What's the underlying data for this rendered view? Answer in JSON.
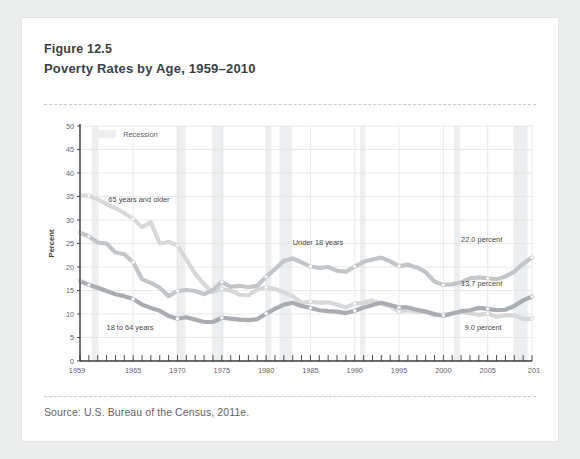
{
  "figure": {
    "number": "Figure 12.5",
    "title": "Poverty Rates by Age, 1959–2010",
    "source": "Source: U.S. Bureau of the Census, 2011e."
  },
  "legend": {
    "recession_label": "Recession",
    "recession_color": "#eceef0"
  },
  "colors": {
    "series_65_plus": "#d6d8da",
    "series_under_18": "#c3c6c9",
    "series_18_64": "#a9adb1",
    "grid": "#e2e3e5",
    "axis": "#3a3a3a",
    "text": "#5f6368"
  },
  "chart_data": {
    "type": "line",
    "title": "Poverty Rates by Age, 1959–2010",
    "xlabel": "",
    "ylabel": "Percent",
    "ylim": [
      0,
      50
    ],
    "ytick_step": 5,
    "yticks": [
      0,
      5,
      10,
      15,
      20,
      25,
      30,
      35,
      40,
      45,
      50
    ],
    "xlim": [
      1959,
      2010
    ],
    "xticks": [
      1959,
      1965,
      1970,
      1975,
      1980,
      1985,
      1990,
      1995,
      2000,
      2005,
      2010
    ],
    "xtick_minor_step": 1,
    "grid": true,
    "legend_position": "top-left",
    "x": [
      1959,
      1960,
      1961,
      1962,
      1963,
      1964,
      1965,
      1966,
      1967,
      1968,
      1969,
      1970,
      1971,
      1972,
      1973,
      1974,
      1975,
      1976,
      1977,
      1978,
      1979,
      1980,
      1981,
      1982,
      1983,
      1984,
      1985,
      1986,
      1987,
      1988,
      1989,
      1990,
      1991,
      1992,
      1993,
      1994,
      1995,
      1996,
      1997,
      1998,
      1999,
      2000,
      2001,
      2002,
      2003,
      2004,
      2005,
      2006,
      2007,
      2008,
      2009,
      2010
    ],
    "series": [
      {
        "name": "65 years and older",
        "label": "65 years and older",
        "end_label": "9.0 percent",
        "color": "#d6d8da",
        "values": [
          35.2,
          35.2,
          34.4,
          33.4,
          32.5,
          31.5,
          30.2,
          28.5,
          29.5,
          25.0,
          25.3,
          24.6,
          21.6,
          18.6,
          16.3,
          14.6,
          15.3,
          15.0,
          14.1,
          14.0,
          15.2,
          15.7,
          15.3,
          14.6,
          13.8,
          12.4,
          12.6,
          12.4,
          12.5,
          12.0,
          11.4,
          12.2,
          12.4,
          12.9,
          12.2,
          11.7,
          10.5,
          10.8,
          10.5,
          10.5,
          9.7,
          9.9,
          10.1,
          10.4,
          10.2,
          9.8,
          10.1,
          9.4,
          9.7,
          9.7,
          8.9,
          9.0
        ]
      },
      {
        "name": "Under 18 years",
        "label": "Under 18 years",
        "end_label": "22.0 percent",
        "color": "#c3c6c9",
        "values": [
          27.3,
          26.5,
          25.2,
          25.0,
          23.1,
          22.7,
          21.0,
          17.4,
          16.6,
          15.6,
          13.8,
          14.9,
          15.1,
          14.9,
          14.2,
          15.1,
          16.8,
          15.8,
          16.0,
          15.7,
          16.0,
          17.9,
          19.5,
          21.3,
          21.8,
          21.0,
          20.1,
          19.8,
          20.0,
          19.2,
          19.0,
          20.1,
          21.1,
          21.6,
          22.0,
          21.2,
          20.2,
          20.5,
          19.9,
          18.9,
          16.9,
          16.2,
          16.3,
          16.7,
          17.6,
          17.8,
          17.6,
          17.4,
          18.0,
          19.0,
          20.7,
          22.0
        ]
      },
      {
        "name": "18 to 64 years",
        "label": "18 to 64 years",
        "end_label": "13.7 percent",
        "color": "#a9adb1",
        "values": [
          17.0,
          16.2,
          15.6,
          14.9,
          14.2,
          13.8,
          13.2,
          12.0,
          11.3,
          10.7,
          9.6,
          9.0,
          9.3,
          8.8,
          8.3,
          8.3,
          9.2,
          9.0,
          8.8,
          8.7,
          8.9,
          10.1,
          11.1,
          12.0,
          12.4,
          11.7,
          11.3,
          10.8,
          10.6,
          10.5,
          10.2,
          10.7,
          11.4,
          11.9,
          12.4,
          11.9,
          11.4,
          11.4,
          10.9,
          10.5,
          10.0,
          9.6,
          10.1,
          10.6,
          10.8,
          11.3,
          11.1,
          10.8,
          10.9,
          11.7,
          12.9,
          13.7
        ]
      }
    ],
    "recessions": [
      {
        "start": 1960.3,
        "end": 1961.1
      },
      {
        "start": 1969.9,
        "end": 1970.9
      },
      {
        "start": 1973.9,
        "end": 1975.2
      },
      {
        "start": 1980.0,
        "end": 1980.6
      },
      {
        "start": 1981.5,
        "end": 1982.9
      },
      {
        "start": 1990.6,
        "end": 1991.2
      },
      {
        "start": 2001.2,
        "end": 2001.9
      },
      {
        "start": 2007.9,
        "end": 2009.5
      }
    ],
    "annotations": [
      {
        "text": "22.0 percent",
        "series": "Under 18 years"
      },
      {
        "text": "13.7 percent",
        "series": "18 to 64 years"
      },
      {
        "text": "9.0 percent",
        "series": "65 years and older"
      }
    ]
  }
}
